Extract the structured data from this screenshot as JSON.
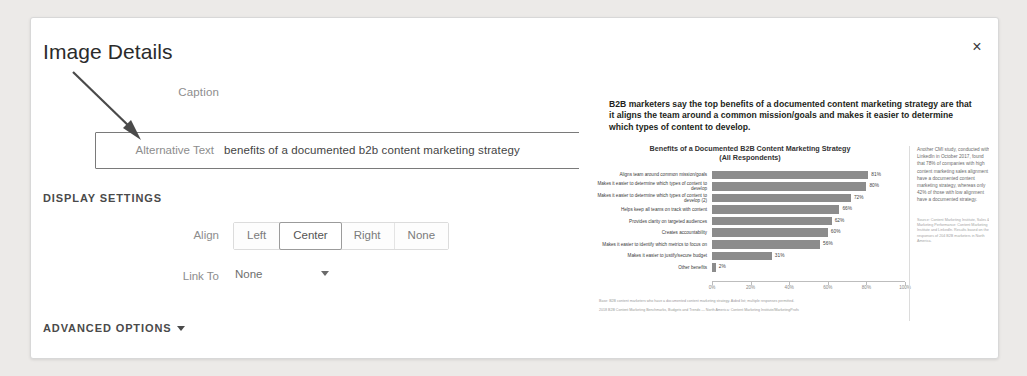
{
  "modal": {
    "title": "Image Details",
    "close_label": "×"
  },
  "fields": {
    "caption_label": "Caption",
    "caption_value": "",
    "alt_label": "Alternative Text",
    "alt_value": "benefits of a documented b2b content marketing strategy"
  },
  "display_settings": {
    "heading": "DISPLAY SETTINGS",
    "align_label": "Align",
    "align_options": [
      "Left",
      "Center",
      "Right",
      "None"
    ],
    "align_selected": "Center",
    "link_to_label": "Link To",
    "link_to_value": "None"
  },
  "advanced": {
    "label": "ADVANCED OPTIONS"
  },
  "preview": {
    "lead": "B2B marketers say the top benefits of a documented content marketing strategy are that it aligns the team around a common mission/goals and makes it easier to determine which types of content to develop.",
    "footnotes": [
      "Base: B2B content marketers who have a documented content marketing strategy. Aided list; multiple responses permitted.",
      "2018 B2B Content Marketing Benchmarks, Budgets and Trends — North America: Content Marketing Institute/MarketingProfs"
    ],
    "side_note": "Another CMI study, conducted with LinkedIn in October 2017, found that 78% of companies with high content marketing sales alignment have a documented content marketing strategy, whereas only 42% of those with low alignment have a documented strategy.",
    "side_source": "Source: Content Marketing Institute, Sales & Marketing Performance: Content Marketing Institute and LinkedIn. Results based on the responses of 204 B2B marketers in North America."
  },
  "chart_data": {
    "type": "bar",
    "orientation": "horizontal",
    "title": "Benefits of a Documented B2B Content Marketing Strategy",
    "subtitle": "(All Respondents)",
    "xlabel": "",
    "ylabel": "",
    "xlim": [
      0,
      100
    ],
    "xticks": [
      0,
      20,
      40,
      60,
      80,
      100
    ],
    "xticklabels": [
      "0%",
      "20%",
      "40%",
      "60%",
      "80%",
      "100%"
    ],
    "grid": false,
    "legend": false,
    "categories": [
      "Aligns team around common mission/goals",
      "Makes it easier to determine which types of content to develop",
      "Makes it easier to determine which types of content to develop (2)",
      "Helps keep all teams on track with content",
      "Provides clarity on targeted audiences",
      "Creates accountability",
      "Makes it easier to identify which metrics to focus on",
      "Makes it easier to justify/secure budget",
      "Other benefits"
    ],
    "values": [
      81,
      80,
      72,
      66,
      62,
      60,
      56,
      31,
      2
    ],
    "value_labels": [
      "81%",
      "80%",
      "72%",
      "66%",
      "62%",
      "60%",
      "56%",
      "31%",
      "2%"
    ],
    "bar_color": "#8c8c8c"
  }
}
